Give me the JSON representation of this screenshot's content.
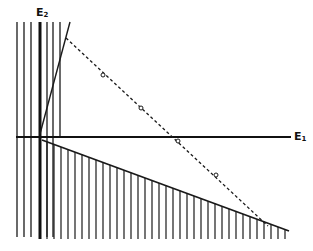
{
  "diagram": {
    "axes": {
      "x_label": "E",
      "x_label_sub": "1",
      "y_label": "E",
      "y_label_sub": "2"
    },
    "colors": {
      "ink": "#1a1a1a",
      "background": "#ffffff"
    },
    "elements": [
      {
        "kind": "axis",
        "name": "E1-axis",
        "orientation": "horizontal"
      },
      {
        "kind": "axis",
        "name": "E2-axis",
        "orientation": "vertical"
      },
      {
        "kind": "hatched-region",
        "name": "left-vertical-band"
      },
      {
        "kind": "line",
        "name": "steep-boundary-line"
      },
      {
        "kind": "dashed-line",
        "name": "dashed-trajectory",
        "markers": 4
      },
      {
        "kind": "hatched-region",
        "name": "lower-wedge-region"
      }
    ]
  }
}
